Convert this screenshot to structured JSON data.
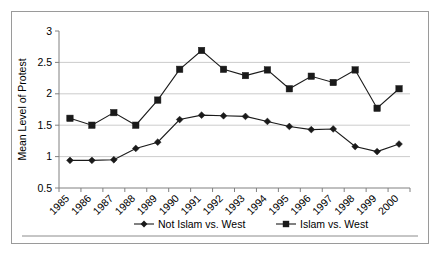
{
  "chart_data": {
    "type": "line",
    "title": "",
    "xlabel": "",
    "ylabel": "Mean Level of Protest",
    "ylim": [
      0.5,
      3
    ],
    "yticks": [
      "0.5",
      "1",
      "1.5",
      "2",
      "2.5",
      "3"
    ],
    "grid": true,
    "legend_position": "bottom",
    "categories": [
      "1985",
      "1986",
      "1987",
      "1988",
      "1989",
      "1990",
      "1991",
      "1992",
      "1993",
      "1994",
      "1995",
      "1996",
      "1997",
      "1998",
      "1999",
      "2000"
    ],
    "series": [
      {
        "name": "Not Islam vs. West",
        "marker": "diamond",
        "values": [
          0.94,
          0.94,
          0.95,
          1.13,
          1.23,
          1.59,
          1.66,
          1.65,
          1.64,
          1.56,
          1.48,
          1.43,
          1.44,
          1.16,
          1.08,
          1.2
        ]
      },
      {
        "name": "Islam vs. West",
        "marker": "square",
        "values": [
          1.61,
          1.5,
          1.7,
          1.5,
          1.9,
          2.39,
          2.69,
          2.39,
          2.29,
          2.38,
          2.08,
          2.28,
          2.18,
          2.38,
          1.77,
          2.08
        ]
      }
    ]
  },
  "colors": {
    "series_stroke": "#1a1a1a",
    "gridline": "#bfbfbf",
    "axis": "#808080",
    "frame_border": "#9a9a9a",
    "background": "#ffffff"
  }
}
